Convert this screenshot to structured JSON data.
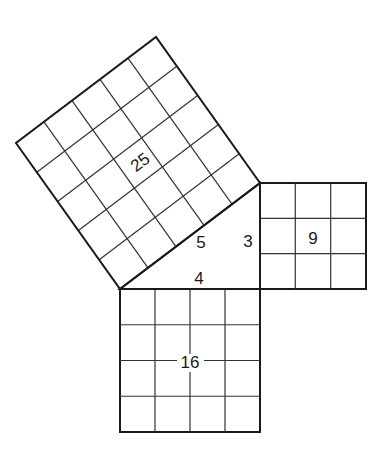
{
  "diagram": {
    "triangle": {
      "sides": {
        "hypotenuse": "5",
        "vertical_leg": "3",
        "horizontal_leg": "4"
      }
    },
    "squares": [
      {
        "id": "hypotenuse-square",
        "side": 5,
        "area_label": "25"
      },
      {
        "id": "vertical-leg-square",
        "side": 3,
        "area_label": "9"
      },
      {
        "id": "horizontal-leg-square",
        "side": 4,
        "area_label": "16"
      }
    ],
    "colors": {
      "line": "#1a1a1a",
      "background": "#ffffff"
    }
  }
}
